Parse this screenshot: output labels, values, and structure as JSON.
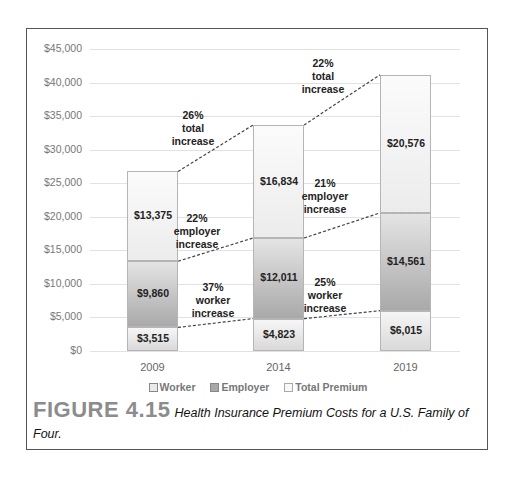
{
  "chart_data": {
    "type": "bar",
    "stacked": true,
    "title": "",
    "xlabel": "",
    "ylabel": "",
    "ylim": [
      0,
      45000
    ],
    "yticks": [
      0,
      5000,
      10000,
      15000,
      20000,
      25000,
      30000,
      35000,
      40000,
      45000
    ],
    "ytick_labels": [
      "$0",
      "$5,000",
      "$10,000",
      "$15,000",
      "$20,000",
      "$25,000",
      "$30,000",
      "$35,000",
      "$40,000",
      "$45,000"
    ],
    "grid": true,
    "legend_position": "bottom",
    "categories": [
      "2009",
      "2014",
      "2019"
    ],
    "series": [
      {
        "name": "Worker",
        "values": [
          3515,
          4823,
          6015
        ],
        "labels": [
          "$3,515",
          "$4,823",
          "$6,015"
        ],
        "color": "#d9d9d9"
      },
      {
        "name": "Employer",
        "values": [
          9860,
          12011,
          14561
        ],
        "labels": [
          "$9,860",
          "$12,011",
          "$14,561"
        ],
        "color": "#a9a9a9"
      },
      {
        "name": "Total Premium",
        "values": [
          13375,
          16834,
          20576
        ],
        "labels": [
          "$13,375",
          "$16,834",
          "$20,576"
        ],
        "color": "#f2f2f2"
      }
    ],
    "annotations": [
      {
        "between": [
          "2009",
          "2014"
        ],
        "series": "Total Premium",
        "text": [
          "26%",
          "total",
          "increase"
        ]
      },
      {
        "between": [
          "2009",
          "2014"
        ],
        "series": "Employer",
        "text": [
          "22%",
          "employer",
          "increase"
        ]
      },
      {
        "between": [
          "2009",
          "2014"
        ],
        "series": "Worker",
        "text": [
          "37%",
          "worker",
          "increase"
        ]
      },
      {
        "between": [
          "2014",
          "2019"
        ],
        "series": "Total Premium",
        "text": [
          "22%",
          "total",
          "increase"
        ]
      },
      {
        "between": [
          "2014",
          "2019"
        ],
        "series": "Employer",
        "text": [
          "21%",
          "employer",
          "increase"
        ]
      },
      {
        "between": [
          "2014",
          "2019"
        ],
        "series": "Worker",
        "text": [
          "25%",
          "worker",
          "increase"
        ]
      }
    ]
  },
  "legend": {
    "items": [
      {
        "label": "Worker"
      },
      {
        "label": "Employer"
      },
      {
        "label": "Total Premium"
      }
    ]
  },
  "caption": {
    "figure_number": "FIGURE 4.15",
    "title": "Health Insurance Premium Costs for a U.S. Family of Four."
  }
}
